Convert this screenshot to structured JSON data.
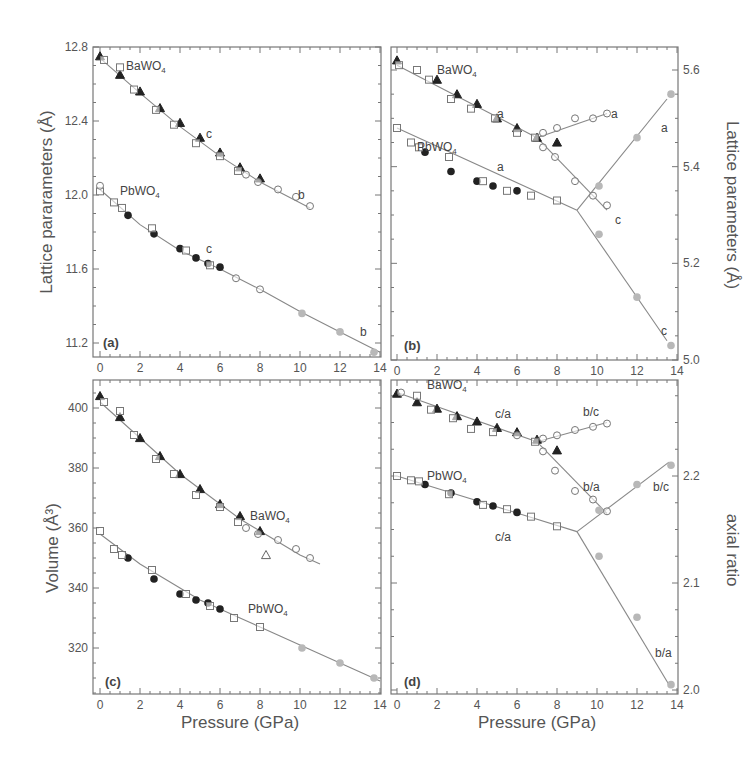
{
  "chart_data": [
    {
      "panel": "(a)",
      "type": "scatter",
      "xlabel": "",
      "ylabel": "Lattice pararameters (Å)",
      "xlim": [
        0,
        14
      ],
      "ylim": [
        11.2,
        12.8
      ],
      "xticks": [
        "0",
        "2",
        "4",
        "6",
        "8",
        "10",
        "12",
        "14"
      ],
      "yticks": [
        "11.2",
        "11.6",
        "12.0",
        "12.4",
        "12.8"
      ],
      "annotations": [
        {
          "text": "BaWO4",
          "x": 1.3,
          "y": 12.7
        },
        {
          "text": "c",
          "x": 5.3,
          "y": 12.33
        },
        {
          "text": "b",
          "x": 9.9,
          "y": 12.0
        },
        {
          "text": "PbWO4",
          "x": 1.0,
          "y": 12.02
        },
        {
          "text": "c",
          "x": 5.3,
          "y": 11.71
        },
        {
          "text": "b",
          "x": 13.0,
          "y": 11.26
        }
      ],
      "fits": [
        {
          "name": "BaWO4",
          "x": [
            0,
            2,
            4,
            6,
            8,
            10.5
          ],
          "y": [
            12.74,
            12.55,
            12.37,
            12.21,
            12.07,
            11.93
          ]
        },
        {
          "name": "PbWO4",
          "x": [
            0,
            2,
            4,
            6,
            8,
            10,
            12,
            14
          ],
          "y": [
            12.03,
            11.84,
            11.7,
            11.6,
            11.49,
            11.37,
            11.26,
            11.15
          ]
        }
      ],
      "series": [
        {
          "name": "BaWO4 filled triangle",
          "marker": "triangle-filled",
          "x": [
            0,
            1,
            2,
            3,
            4,
            5,
            6,
            7,
            8
          ],
          "y": [
            12.75,
            12.65,
            12.56,
            12.47,
            12.39,
            12.31,
            12.23,
            12.15,
            12.09
          ]
        },
        {
          "name": "BaWO4 open square",
          "marker": "square-open",
          "x": [
            0.2,
            1,
            1.7,
            2.8,
            3.7,
            4.8,
            6,
            6.9
          ],
          "y": [
            12.73,
            12.69,
            12.57,
            12.46,
            12.38,
            12.28,
            12.21,
            12.13
          ]
        },
        {
          "name": "BaWO4 open circle",
          "marker": "circle-open",
          "x": [
            7.3,
            7.9,
            8.9,
            9.8,
            10.5
          ],
          "y": [
            12.11,
            12.07,
            12.03,
            11.99,
            11.94
          ]
        },
        {
          "name": "PbWO4 filled circle",
          "marker": "circle-filled",
          "x": [
            1.4,
            2.7,
            4.0,
            4.8,
            5.4,
            6.0
          ],
          "y": [
            11.89,
            11.79,
            11.71,
            11.66,
            11.63,
            11.61
          ]
        },
        {
          "name": "PbWO4 open square",
          "marker": "square-open",
          "x": [
            0,
            0.7,
            1.1,
            2.6,
            4.3,
            5.5
          ],
          "y": [
            12.02,
            11.96,
            11.93,
            11.82,
            11.7,
            11.62
          ]
        },
        {
          "name": "PbWO4 open circle",
          "marker": "circle-open",
          "x": [
            0,
            6.8,
            8.0
          ],
          "y": [
            12.05,
            11.55,
            11.49
          ]
        },
        {
          "name": "PbWO4 gray circle",
          "marker": "circle-gray",
          "x": [
            10.1,
            12.0,
            13.7
          ],
          "y": [
            11.36,
            11.26,
            11.15
          ]
        }
      ]
    },
    {
      "panel": "(b)",
      "type": "scatter",
      "xlabel": "",
      "ylabel": "Lattice parameters (Å)",
      "ylabel_side": "right",
      "xlim": [
        0,
        14
      ],
      "ylim": [
        5.0,
        5.6
      ],
      "xticks": [
        "0",
        "2",
        "4",
        "6",
        "8",
        "10",
        "12",
        "14"
      ],
      "yticks": [
        "5.0",
        "5.2",
        "5.4",
        "5.6"
      ],
      "annotations": [
        {
          "text": "BaWO4",
          "x": 2.0,
          "y": 5.6
        },
        {
          "text": "a",
          "x": 5.0,
          "y": 5.51
        },
        {
          "text": "a",
          "x": 10.7,
          "y": 5.51
        },
        {
          "text": "a",
          "x": 13.2,
          "y": 5.48
        },
        {
          "text": "PbWO4",
          "x": 1.0,
          "y": 5.44
        },
        {
          "text": "a",
          "x": 5.0,
          "y": 5.4
        },
        {
          "text": "c",
          "x": 10.9,
          "y": 5.29
        },
        {
          "text": "c",
          "x": 13.2,
          "y": 5.06
        }
      ],
      "fits": [
        {
          "name": "BaWO4 a low",
          "x": [
            0,
            7
          ],
          "y": [
            5.61,
            5.46
          ]
        },
        {
          "name": "BaWO4 a high",
          "x": [
            7,
            10.5
          ],
          "y": [
            5.46,
            5.51
          ]
        },
        {
          "name": "BaWO4 c high",
          "x": [
            7,
            10.5
          ],
          "y": [
            5.46,
            5.31
          ]
        },
        {
          "name": "PbWO4 a low",
          "x": [
            0,
            9
          ],
          "y": [
            5.48,
            5.31
          ]
        },
        {
          "name": "PbWO4 a high",
          "x": [
            9,
            13.5
          ],
          "y": [
            5.31,
            5.54
          ]
        },
        {
          "name": "PbWO4 c high",
          "x": [
            9,
            13.5
          ],
          "y": [
            5.31,
            5.04
          ]
        }
      ],
      "series": [
        {
          "name": "BaWO4 filled triangle",
          "marker": "triangle-filled",
          "x": [
            0,
            2,
            3,
            4,
            5,
            6,
            7,
            8
          ],
          "y": [
            5.62,
            5.58,
            5.55,
            5.53,
            5.5,
            5.48,
            5.46,
            5.45
          ]
        },
        {
          "name": "BaWO4 open square",
          "marker": "square-open",
          "x": [
            0.1,
            1,
            1.6,
            2.7,
            3.7,
            4.9,
            6,
            6.9
          ],
          "y": [
            5.61,
            5.6,
            5.58,
            5.54,
            5.52,
            5.5,
            5.47,
            5.46
          ]
        },
        {
          "name": "BaWO4 open circle (a)",
          "marker": "circle-open",
          "x": [
            7.3,
            8,
            8.9,
            9.8,
            10.5
          ],
          "y": [
            5.47,
            5.48,
            5.5,
            5.5,
            5.51
          ]
        },
        {
          "name": "BaWO4 open circle (c)",
          "marker": "circle-open",
          "x": [
            7.3,
            7.9,
            8.9,
            9.8,
            10.5
          ],
          "y": [
            5.44,
            5.42,
            5.37,
            5.34,
            5.32
          ]
        },
        {
          "name": "PbWO4 filled circle",
          "marker": "circle-filled",
          "x": [
            1.4,
            2.7,
            4.0,
            4.8,
            6.0
          ],
          "y": [
            5.43,
            5.39,
            5.37,
            5.36,
            5.35
          ]
        },
        {
          "name": "PbWO4 open square",
          "marker": "square-open",
          "x": [
            0,
            0.7,
            1.1,
            2.6,
            4.3,
            5.5,
            6.7,
            8.0
          ],
          "y": [
            5.48,
            5.45,
            5.44,
            5.42,
            5.37,
            5.35,
            5.34,
            5.33
          ]
        },
        {
          "name": "PbWO4 gray circle (a)",
          "marker": "circle-gray",
          "x": [
            10.1,
            12.0,
            13.7
          ],
          "y": [
            5.36,
            5.46,
            5.55
          ]
        },
        {
          "name": "PbWO4 gray circle (c)",
          "marker": "circle-gray",
          "x": [
            10.1,
            12.0,
            13.7
          ],
          "y": [
            5.26,
            5.13,
            5.03
          ]
        }
      ]
    },
    {
      "panel": "(c)",
      "type": "scatter",
      "xlabel": "Pressure (GPa)",
      "ylabel": "Volume (Å³)",
      "xlim": [
        0,
        14
      ],
      "ylim": [
        305,
        410
      ],
      "xticks": [
        "0",
        "2",
        "4",
        "6",
        "8",
        "10",
        "12",
        "14"
      ],
      "yticks": [
        "320",
        "340",
        "360",
        "380",
        "400"
      ],
      "annotations": [
        {
          "text": "BaWO4",
          "x": 7.5,
          "y": 364
        },
        {
          "text": "PbWO4",
          "x": 7.4,
          "y": 333
        }
      ],
      "fits": [
        {
          "name": "BaWO4",
          "x": [
            0,
            1,
            2,
            3,
            4,
            5,
            6,
            7,
            8,
            9,
            10,
            11
          ],
          "y": [
            402,
            396,
            390,
            384,
            378,
            373,
            368,
            363,
            359,
            355,
            351,
            348
          ]
        },
        {
          "name": "PbWO4",
          "x": [
            0,
            1,
            2,
            3,
            4,
            5,
            6,
            7,
            8,
            9,
            10,
            11,
            12,
            13,
            14
          ],
          "y": [
            358,
            353,
            348,
            344,
            340,
            336,
            333,
            330,
            327,
            324,
            321,
            318,
            315,
            312,
            309
          ]
        }
      ],
      "series": [
        {
          "name": "BaWO4 filled triangle",
          "marker": "triangle-filled",
          "x": [
            0,
            1,
            2,
            3,
            4,
            5,
            6,
            7,
            8
          ],
          "y": [
            404,
            397,
            390,
            384,
            378,
            373,
            368,
            364,
            359
          ]
        },
        {
          "name": "BaWO4 open square",
          "marker": "square-open",
          "x": [
            0.2,
            1,
            1.7,
            2.8,
            3.7,
            4.8,
            6,
            6.9
          ],
          "y": [
            402,
            399,
            391,
            383,
            378,
            371,
            367,
            362
          ]
        },
        {
          "name": "BaWO4 open circle",
          "marker": "circle-open",
          "x": [
            7.3,
            7.9,
            8.9,
            9.8,
            10.5
          ],
          "y": [
            360,
            358,
            356,
            353,
            350
          ]
        },
        {
          "name": "BaWO4 open triangle",
          "marker": "triangle-open",
          "x": [
            8.3
          ],
          "y": [
            351
          ]
        },
        {
          "name": "PbWO4 filled circle",
          "marker": "circle-filled",
          "x": [
            1.4,
            2.7,
            4.0,
            4.8,
            5.4,
            6.0
          ],
          "y": [
            350,
            343,
            338,
            336,
            335,
            333
          ]
        },
        {
          "name": "PbWO4 open square",
          "marker": "square-open",
          "x": [
            0,
            0.7,
            1.1,
            2.6,
            4.3,
            5.5,
            6.7,
            8.0
          ],
          "y": [
            359,
            353,
            351,
            346,
            338,
            334,
            330,
            327
          ]
        },
        {
          "name": "PbWO4 gray circle",
          "marker": "circle-gray",
          "x": [
            10.1,
            12.0,
            13.7
          ],
          "y": [
            320,
            315,
            310
          ]
        }
      ]
    },
    {
      "panel": "(d)",
      "type": "scatter",
      "xlabel": "Pressure (GPa)",
      "ylabel": "axial ratio",
      "ylabel_side": "right",
      "xlim": [
        0,
        14
      ],
      "ylim": [
        2.0,
        2.29
      ],
      "xticks": [
        "0",
        "2",
        "4",
        "6",
        "8",
        "10",
        "12",
        "14"
      ],
      "yticks": [
        "2.0",
        "2.1",
        "2.2"
      ],
      "annotations": [
        {
          "text": "BaWO4",
          "x": 1.5,
          "y": 2.285
        },
        {
          "text": "c/a",
          "x": 4.9,
          "y": 2.258
        },
        {
          "text": "b/c",
          "x": 9.3,
          "y": 2.26
        },
        {
          "text": "b/a",
          "x": 9.3,
          "y": 2.19
        },
        {
          "text": "b/c",
          "x": 12.8,
          "y": 2.19
        },
        {
          "text": "PbWO4",
          "x": 1.5,
          "y": 2.2
        },
        {
          "text": "c/a",
          "x": 4.9,
          "y": 2.143
        },
        {
          "text": "b/a",
          "x": 12.9,
          "y": 2.035
        }
      ],
      "fits": [
        {
          "name": "BaWO4 c/a",
          "x": [
            0,
            7
          ],
          "y": [
            2.278,
            2.232
          ]
        },
        {
          "name": "BaWO4 b/c",
          "x": [
            7,
            10.5
          ],
          "y": [
            2.232,
            2.25
          ]
        },
        {
          "name": "BaWO4 b/a",
          "x": [
            7,
            10.5
          ],
          "y": [
            2.232,
            2.165
          ]
        },
        {
          "name": "PbWO4 c/a",
          "x": [
            0,
            9
          ],
          "y": [
            2.2,
            2.148
          ]
        },
        {
          "name": "PbWO4 b/c",
          "x": [
            9,
            13.6
          ],
          "y": [
            2.148,
            2.213
          ]
        },
        {
          "name": "PbWO4 b/a",
          "x": [
            9,
            13.6
          ],
          "y": [
            2.148,
            2.005
          ]
        }
      ],
      "series": [
        {
          "name": "BaWO4 filled triangle",
          "marker": "triangle-filled",
          "x": [
            0,
            1,
            2,
            3,
            4,
            5,
            6,
            7,
            8
          ],
          "y": [
            2.277,
            2.269,
            2.263,
            2.256,
            2.251,
            2.245,
            2.241,
            2.234,
            2.224
          ]
        },
        {
          "name": "BaWO4 open square",
          "marker": "square-open",
          "x": [
            1,
            1.7,
            2.8,
            3.7,
            4.8,
            6.9
          ],
          "y": [
            2.275,
            2.262,
            2.254,
            2.244,
            2.241,
            2.232
          ]
        },
        {
          "name": "BaWO4 open circle (b/c)",
          "marker": "circle-open",
          "x": [
            0.2,
            7.3,
            8,
            8.9,
            9.8,
            10.5
          ],
          "y": [
            2.278,
            2.235,
            2.238,
            2.243,
            2.246,
            2.249
          ]
        },
        {
          "name": "BaWO4 open circle (b/a)",
          "marker": "circle-open",
          "x": [
            6,
            7.3,
            7.9,
            8.9,
            9.8,
            10.5
          ],
          "y": [
            2.238,
            2.223,
            2.205,
            2.186,
            2.178,
            2.167
          ]
        },
        {
          "name": "PbWO4 filled circle",
          "marker": "circle-filled",
          "x": [
            1.4,
            2.7,
            4.0,
            4.8,
            6.0
          ],
          "y": [
            2.192,
            2.184,
            2.176,
            2.172,
            2.166
          ]
        },
        {
          "name": "PbWO4 open square",
          "marker": "square-open",
          "x": [
            0,
            0.7,
            1.1,
            2.6,
            4.3,
            5.5,
            6.7,
            8.0
          ],
          "y": [
            2.2,
            2.196,
            2.195,
            2.183,
            2.173,
            2.169,
            2.162,
            2.153
          ]
        },
        {
          "name": "PbWO4 gray circle (b/c)",
          "marker": "circle-gray",
          "x": [
            10.1,
            12.0,
            13.7
          ],
          "y": [
            2.168,
            2.192,
            2.21
          ]
        },
        {
          "name": "PbWO4 gray circle (b/a)",
          "marker": "circle-gray",
          "x": [
            10.1,
            12.0,
            13.7
          ],
          "y": [
            2.125,
            2.068,
            2.005
          ]
        }
      ]
    }
  ],
  "labels": {
    "a_ylabel": "Lattice pararameters (Å)",
    "b_ylabel": "Lattice parameters (Å)",
    "c_ylabel": "Volume (Å³)",
    "d_ylabel": "axial ratio",
    "xlabel": "Pressure (GPa)",
    "panel_a": "(a)",
    "panel_b": "(b)",
    "panel_c": "(c)",
    "panel_d": "(d)"
  },
  "colors": {
    "frame": "#777777",
    "fit_line": "#888888",
    "marker_dark": "#222222",
    "marker_gray": "#b8b8b8",
    "text": "#555555"
  }
}
